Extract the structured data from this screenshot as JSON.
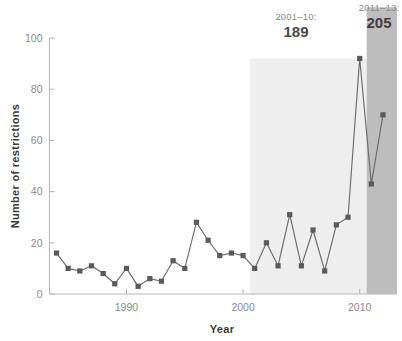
{
  "chart_data": {
    "type": "line",
    "title": "",
    "xlabel": "Year",
    "ylabel": "Number of restrictions",
    "xlim": [
      1983.4,
      2013.2
    ],
    "ylim": [
      0,
      100
    ],
    "xticks": [
      1990,
      2000,
      2010
    ],
    "xtick_labels": [
      "1990",
      "2000",
      "2010"
    ],
    "yticks": [
      0,
      20,
      40,
      60,
      80,
      100
    ],
    "ytick_labels": [
      "0",
      "20",
      "40",
      "60",
      "80",
      "100"
    ],
    "grid": false,
    "legend": "none",
    "marker": "square",
    "series": [
      {
        "name": "Number of restrictions",
        "x": [
          1984,
          1985,
          1986,
          1987,
          1988,
          1989,
          1990,
          1991,
          1992,
          1993,
          1994,
          1995,
          1996,
          1997,
          1998,
          1999,
          2000,
          2001,
          2002,
          2003,
          2004,
          2005,
          2006,
          2007,
          2008,
          2009,
          2010,
          2011,
          2012
        ],
        "values": [
          16,
          10,
          9,
          11,
          8,
          4,
          10,
          3,
          6,
          5,
          13,
          10,
          28,
          21,
          15,
          16,
          15,
          10,
          20,
          11,
          31,
          11,
          25,
          9,
          27,
          30,
          92,
          43,
          70
        ]
      }
    ],
    "shaded_bands": [
      {
        "name": "band-2001-2010",
        "x_start": 2000.6,
        "x_end": 2010.6,
        "y_top": 92,
        "color": "#eeeeee",
        "label_period": "2001–10:",
        "label_value": "189"
      },
      {
        "name": "band-2011-2013",
        "x_start": 2010.6,
        "x_end": 2013.2,
        "y_top": 112,
        "color": "#bdbdbd",
        "label_period": "2011–13:",
        "label_value": "205"
      }
    ],
    "colors": {
      "line": "#6b6b6b",
      "marker": "#5a5a5a",
      "axis": "#b8b8b8",
      "tick_text": "#8c8c8c",
      "axis_label": "#3a3a3a",
      "band_light": "#eeeeee",
      "band_dark": "#bdbdbd",
      "background": "#ffffff"
    }
  },
  "annotations": {
    "light_band": {
      "period": "2001–10:",
      "value": "189"
    },
    "dark_band": {
      "period": "2011–13:",
      "value": "205"
    }
  },
  "axes": {
    "y_label": "Number of restrictions",
    "x_label": "Year",
    "y_ticks": [
      "100",
      "80",
      "60",
      "40",
      "20",
      "0"
    ],
    "x_ticks": [
      "1990",
      "2000",
      "2010"
    ]
  }
}
